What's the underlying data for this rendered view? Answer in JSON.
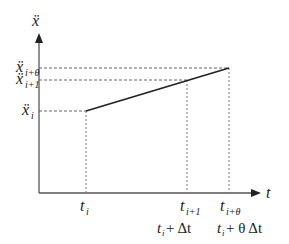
{
  "diagram": {
    "y_axis_label": "ẍ",
    "x_axis_label": "t",
    "y_labels": [
      {
        "base": "ẍ",
        "sub": "i+θ"
      },
      {
        "base": "ẍ",
        "sub": "i+1"
      },
      {
        "base": "ẍ",
        "sub": "i"
      }
    ],
    "x_labels": [
      {
        "base": "t",
        "sub": "i"
      },
      {
        "base": "t",
        "sub": "i+1"
      },
      {
        "base": "t",
        "sub": "i+θ"
      }
    ],
    "x_expressions": [
      {
        "base": "t",
        "sub": "i",
        "rest": " + Δt"
      },
      {
        "base": "t",
        "sub": "i",
        "rest": " + θ Δt"
      }
    ],
    "line": {
      "from": {
        "t": "t_i",
        "value": "ẍ_i"
      },
      "to": {
        "t": "t_{i+θ}",
        "value": "ẍ_{i+θ}"
      }
    },
    "colors": {
      "axis": "#555555",
      "line": "#222222",
      "guide": "#666666"
    }
  }
}
